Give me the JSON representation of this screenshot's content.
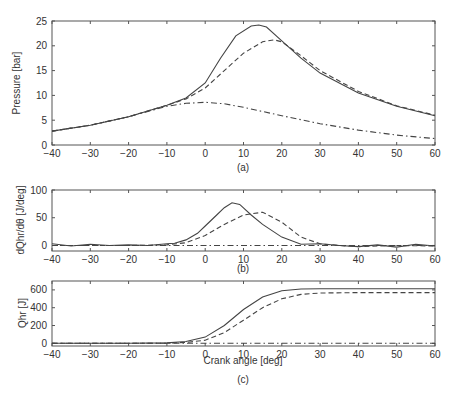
{
  "chart_data": [
    {
      "id": "a",
      "type": "line",
      "caption": "(a)",
      "xlabel": "",
      "ylabel": "Pressure [bar]",
      "xlim": [
        -40,
        60
      ],
      "ylim": [
        0,
        25
      ],
      "xticks": [
        -40,
        -30,
        -20,
        -10,
        0,
        10,
        20,
        30,
        40,
        50,
        60
      ],
      "yticks": [
        0,
        5,
        10,
        15,
        20,
        25
      ],
      "grid": false,
      "series": [
        {
          "name": "measured",
          "style": "solid",
          "x": [
            -40,
            -30,
            -20,
            -10,
            -5,
            0,
            4,
            8,
            12,
            14,
            16,
            20,
            25,
            30,
            40,
            50,
            60
          ],
          "y": [
            2.8,
            4.0,
            5.7,
            8.0,
            9.5,
            12.5,
            17.5,
            22.0,
            24.0,
            24.2,
            23.8,
            21.0,
            17.5,
            14.5,
            10.5,
            7.8,
            5.9
          ]
        },
        {
          "name": "model",
          "style": "dashed",
          "x": [
            -40,
            -30,
            -20,
            -10,
            -5,
            0,
            5,
            10,
            15,
            18,
            20,
            25,
            30,
            40,
            50,
            60
          ],
          "y": [
            2.8,
            4.0,
            5.7,
            8.0,
            9.3,
            11.5,
            15.0,
            18.5,
            20.8,
            21.2,
            20.8,
            18.0,
            15.0,
            10.8,
            7.9,
            6.0
          ]
        },
        {
          "name": "motoring",
          "style": "dashdot",
          "x": [
            -40,
            -30,
            -20,
            -10,
            -5,
            0,
            5,
            10,
            20,
            30,
            40,
            50,
            60
          ],
          "y": [
            2.8,
            4.0,
            5.7,
            7.8,
            8.4,
            8.6,
            8.3,
            7.6,
            5.9,
            4.3,
            3.0,
            2.0,
            1.3
          ]
        }
      ]
    },
    {
      "id": "b",
      "type": "line",
      "caption": "(b)",
      "xlabel": "",
      "ylabel": "dQhr/dθ [J/deg]",
      "xlim": [
        -40,
        60
      ],
      "ylim": [
        -10,
        100
      ],
      "xticks": [
        -40,
        -30,
        -20,
        -10,
        0,
        10,
        20,
        30,
        40,
        50,
        60
      ],
      "yticks": [
        0,
        50,
        100
      ],
      "grid": false,
      "series": [
        {
          "name": "measured",
          "style": "solid",
          "x": [
            -40,
            -35,
            -30,
            -25,
            -20,
            -15,
            -10,
            -8,
            -5,
            -2,
            0,
            3,
            5,
            7,
            9,
            12,
            15,
            20,
            25,
            30,
            35,
            40,
            45,
            50,
            55,
            60
          ],
          "y": [
            3,
            -1,
            2,
            0,
            1,
            0,
            3,
            4,
            10,
            22,
            35,
            55,
            68,
            77,
            74,
            55,
            38,
            15,
            2,
            3,
            0,
            -2,
            1,
            -3,
            2,
            -1
          ]
        },
        {
          "name": "model",
          "style": "dashed",
          "x": [
            -40,
            -30,
            -20,
            -10,
            -5,
            0,
            5,
            10,
            15,
            20,
            25,
            30,
            35,
            40,
            50,
            60
          ],
          "y": [
            0,
            0,
            0,
            1,
            5,
            18,
            38,
            55,
            60,
            42,
            15,
            3,
            0,
            -2,
            0,
            -1
          ]
        },
        {
          "name": "motoring",
          "style": "dashdot",
          "x": [
            -40,
            -20,
            0,
            20,
            40,
            60
          ],
          "y": [
            0,
            0,
            0,
            0,
            0,
            0
          ]
        }
      ]
    },
    {
      "id": "c",
      "type": "line",
      "caption": "(c)",
      "xlabel": "Crank angle [deg]",
      "ylabel": "Qhr [J]",
      "xlim": [
        -40,
        60
      ],
      "ylim": [
        -30,
        700
      ],
      "xticks": [
        -40,
        -30,
        -20,
        -10,
        0,
        10,
        20,
        30,
        40,
        50,
        60
      ],
      "yticks": [
        0,
        200,
        400,
        600
      ],
      "grid": false,
      "series": [
        {
          "name": "measured",
          "style": "solid",
          "x": [
            -40,
            -20,
            -10,
            -5,
            0,
            5,
            10,
            15,
            20,
            25,
            30,
            40,
            50,
            60
          ],
          "y": [
            0,
            0,
            5,
            20,
            70,
            200,
            380,
            520,
            590,
            610,
            612,
            612,
            612,
            612
          ]
        },
        {
          "name": "model",
          "style": "dashed",
          "x": [
            -40,
            -20,
            -10,
            -5,
            0,
            5,
            10,
            15,
            20,
            25,
            30,
            40,
            50,
            60
          ],
          "y": [
            0,
            0,
            2,
            10,
            35,
            120,
            260,
            400,
            500,
            550,
            565,
            570,
            570,
            570
          ]
        },
        {
          "name": "motoring",
          "style": "dashdot",
          "x": [
            -40,
            -20,
            0,
            20,
            40,
            60
          ],
          "y": [
            0,
            0,
            0,
            0,
            0,
            0
          ]
        }
      ]
    }
  ],
  "labels": {
    "a_ylabel": "Pressure [bar]",
    "a_caption": "(a)",
    "b_ylabel": "dQhr/dθ [J/deg]",
    "b_caption": "(b)",
    "c_ylabel": "Qhr [J]",
    "c_xlabel": "Crank angle [deg]",
    "c_caption": "(c)"
  }
}
